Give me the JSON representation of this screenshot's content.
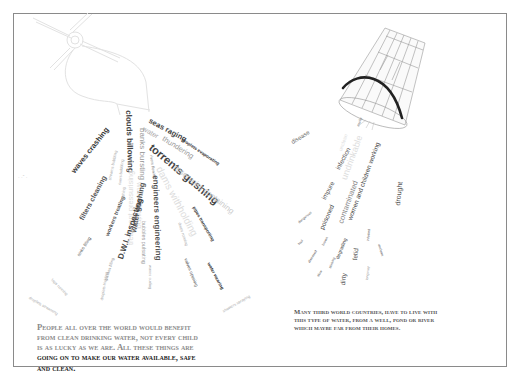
{
  "left_panel": {
    "drawing": "tap-icon",
    "words": [
      {
        "text": "seas raging",
        "x": 151,
        "y": 117,
        "rot": 28,
        "size": 7.5,
        "color": "#444",
        "weight": "bold"
      },
      {
        "text": "water",
        "x": 145,
        "y": 125,
        "rot": 30,
        "size": 7,
        "color": "#aaa",
        "weight": "normal"
      },
      {
        "text": "thundering",
        "x": 165,
        "y": 135,
        "rot": 32,
        "size": 7.5,
        "color": "#999",
        "weight": "normal"
      },
      {
        "text": "droplets evaporating",
        "x": 183,
        "y": 138,
        "rot": 34,
        "size": 4.5,
        "color": "#333",
        "weight": "bold"
      },
      {
        "text": "torrents gushing",
        "x": 154,
        "y": 142,
        "rot": 40,
        "size": 11,
        "color": "#444",
        "weight": "bold"
      },
      {
        "text": "reservoirs containing",
        "x": 177,
        "y": 164,
        "rot": 38,
        "size": 8,
        "color": "#ccc",
        "weight": "normal"
      },
      {
        "text": "dams withholding",
        "x": 163,
        "y": 165,
        "rot": 62,
        "size": 10,
        "color": "#ddd",
        "weight": "normal"
      },
      {
        "text": "rivers flowing",
        "x": 153,
        "y": 155,
        "rot": 82,
        "size": 4,
        "color": "#888",
        "weight": "normal"
      },
      {
        "text": "engineers engineering",
        "x": 159,
        "y": 175,
        "rot": 88,
        "size": 8,
        "color": "#555",
        "weight": "bold"
      },
      {
        "text": "pipes transporting",
        "x": 195,
        "y": 206,
        "rot": 60,
        "size": 4.5,
        "color": "#333",
        "weight": "bold"
      },
      {
        "text": "drops running",
        "x": 181,
        "y": 222,
        "rot": 72,
        "size": 4,
        "color": "#aaa",
        "weight": "normal"
      },
      {
        "text": "valves opening",
        "x": 187,
        "y": 258,
        "rot": 68,
        "size": 4.5,
        "color": "#555",
        "weight": "normal"
      },
      {
        "text": "water wearing",
        "x": 210,
        "y": 262,
        "rot": 62,
        "size": 4.5,
        "color": "#222",
        "weight": "bold"
      },
      {
        "text": "showers spraying",
        "x": 222,
        "y": 310,
        "rot": -30,
        "size": 4,
        "color": "#aaa",
        "weight": "normal"
      },
      {
        "text": "clouds billowing",
        "x": 132,
        "y": 110,
        "rot": 88,
        "size": 8,
        "color": "#444",
        "weight": "bold"
      },
      {
        "text": "banks bursting",
        "x": 146,
        "y": 128,
        "rot": 90,
        "size": 8,
        "color": "#999",
        "weight": "normal"
      },
      {
        "text": "water flowing",
        "x": 143,
        "y": 182,
        "rot": 90,
        "size": 8,
        "color": "#ddd",
        "weight": "normal"
      },
      {
        "text": "bubbles pulsating",
        "x": 146,
        "y": 221,
        "rot": 90,
        "size": 5.5,
        "color": "#999",
        "weight": "normal"
      },
      {
        "text": "waves curling",
        "x": 152,
        "y": 265,
        "rot": 90,
        "size": 4,
        "color": "#aaa",
        "weight": "normal"
      },
      {
        "text": "treatment pressurising",
        "x": 127,
        "y": 245,
        "rot": -90,
        "size": 7.5,
        "color": "#ddd",
        "weight": "normal"
      },
      {
        "text": "water gushing",
        "x": 130,
        "y": 232,
        "rot": -80,
        "size": 7.5,
        "color": "#555",
        "weight": "bold"
      },
      {
        "text": "D.W.I. inspecting",
        "x": 117,
        "y": 258,
        "rot": -72,
        "size": 8,
        "color": "#444",
        "weight": "bold"
      },
      {
        "text": "workers treating",
        "x": 105,
        "y": 235,
        "rot": -68,
        "size": 5.5,
        "color": "#555",
        "weight": "bold"
      },
      {
        "text": "filters cleaning",
        "x": 78,
        "y": 218,
        "rot": -62,
        "size": 7,
        "color": "#555",
        "weight": "bold"
      },
      {
        "text": "waves crashing",
        "x": 70,
        "y": 170,
        "rot": -52,
        "size": 7.5,
        "color": "#333",
        "weight": "bold"
      },
      {
        "text": "streams bubbling",
        "x": 108,
        "y": 180,
        "rot": -78,
        "size": 4,
        "color": "#aaa",
        "weight": "normal"
      },
      {
        "text": "rivers bubbling",
        "x": 118,
        "y": 185,
        "rot": -84,
        "size": 4,
        "color": "#aaa",
        "weight": "normal"
      },
      {
        "text": "bathing",
        "x": 121,
        "y": 200,
        "rot": -84,
        "size": 4,
        "color": "#aaa",
        "weight": "normal"
      },
      {
        "text": "sinks filling",
        "x": 77,
        "y": 255,
        "rot": -58,
        "size": 4.5,
        "color": "#555",
        "weight": "normal"
      },
      {
        "text": "glasses filling",
        "x": 104,
        "y": 280,
        "rot": -72,
        "size": 4,
        "color": "#888",
        "weight": "normal"
      },
      {
        "text": "droplets trickling",
        "x": 100,
        "y": 300,
        "rot": -80,
        "size": 4,
        "color": "#aaa",
        "weight": "normal"
      },
      {
        "text": "taps running",
        "x": 53,
        "y": 278,
        "rot": 45,
        "size": 4,
        "color": "#aaa",
        "weight": "normal"
      },
      {
        "text": "droplets streaming",
        "x": 30,
        "y": 296,
        "rot": 30,
        "size": 4,
        "color": "#aaa",
        "weight": "normal"
      }
    ],
    "caption": {
      "line1": "People  all over the world would benefit",
      "line2": "from clean drinking water, not every child",
      "line3": "is as lucky as we are. All these things are",
      "line4": "going on to make our water available, safe",
      "line5": "and clean."
    }
  },
  "right_panel": {
    "drawing": "bucket-icon",
    "words": [
      {
        "text": "disease",
        "x": 290,
        "y": 140,
        "rot": -32,
        "size": 6,
        "color": "#666",
        "weight": "normal"
      },
      {
        "text": "murky",
        "x": 357,
        "y": 126,
        "rot": -70,
        "size": 3.5,
        "color": "#666",
        "weight": "normal"
      },
      {
        "text": "unclean",
        "x": 338,
        "y": 150,
        "rot": -70,
        "size": 5,
        "color": "#ddd",
        "weight": "normal"
      },
      {
        "text": "infection",
        "x": 335,
        "y": 168,
        "rot": -62,
        "size": 6.5,
        "color": "#555",
        "weight": "normal"
      },
      {
        "text": "undrinkable",
        "x": 340,
        "y": 178,
        "rot": -70,
        "size": 9,
        "color": "#ddd",
        "weight": "normal"
      },
      {
        "text": "women and children working",
        "x": 347,
        "y": 219,
        "rot": -70,
        "size": 6.5,
        "color": "#444",
        "weight": "normal"
      },
      {
        "text": "impure",
        "x": 321,
        "y": 198,
        "rot": -62,
        "size": 6.5,
        "color": "#555",
        "weight": "normal"
      },
      {
        "text": "contaminated",
        "x": 337,
        "y": 222,
        "rot": -70,
        "size": 7.5,
        "color": "#888",
        "weight": "normal"
      },
      {
        "text": "drought",
        "x": 394,
        "y": 205,
        "rot": -84,
        "size": 7,
        "color": "#555",
        "weight": "normal"
      },
      {
        "text": "poisoned",
        "x": 319,
        "y": 228,
        "rot": -66,
        "size": 6.5,
        "color": "#444",
        "weight": "normal"
      },
      {
        "text": "dangerous",
        "x": 298,
        "y": 222,
        "rot": -40,
        "size": 3.5,
        "color": "#666",
        "weight": "normal"
      },
      {
        "text": "foul",
        "x": 298,
        "y": 244,
        "rot": -50,
        "size": 3.5,
        "color": "#555",
        "weight": "normal"
      },
      {
        "text": "diseased",
        "x": 308,
        "y": 262,
        "rot": -58,
        "size": 3.5,
        "color": "#555",
        "weight": "normal"
      },
      {
        "text": "brown",
        "x": 322,
        "y": 245,
        "rot": -62,
        "size": 3.5,
        "color": "#555",
        "weight": "normal"
      },
      {
        "text": "slow",
        "x": 317,
        "y": 276,
        "rot": -58,
        "size": 3.5,
        "color": "#555",
        "weight": "normal"
      },
      {
        "text": "stinking",
        "x": 329,
        "y": 268,
        "rot": -68,
        "size": 3.5,
        "color": "#555",
        "weight": "normal"
      },
      {
        "text": "degrading",
        "x": 335,
        "y": 258,
        "rot": -68,
        "size": 5,
        "color": "#444",
        "weight": "normal"
      },
      {
        "text": "dirty",
        "x": 340,
        "y": 285,
        "rot": -84,
        "size": 6.5,
        "color": "#555",
        "weight": "normal"
      },
      {
        "text": "fetid",
        "x": 352,
        "y": 260,
        "rot": -84,
        "size": 6.5,
        "color": "#555",
        "weight": "normal"
      },
      {
        "text": "infested",
        "x": 367,
        "y": 241,
        "rot": -84,
        "size": 3.5,
        "color": "#555",
        "weight": "normal"
      },
      {
        "text": "long way",
        "x": 366,
        "y": 280,
        "rot": -84,
        "size": 3.5,
        "color": "#888",
        "weight": "normal"
      },
      {
        "text": "unclean",
        "x": 380,
        "y": 244,
        "rot": 74,
        "size": 3.5,
        "color": "#555",
        "weight": "normal"
      }
    ],
    "caption": {
      "line1": "Many third world countries, have to live with",
      "line2": "this type of water, from a well, pond or river",
      "line3": "which maybe far from their homes."
    }
  }
}
